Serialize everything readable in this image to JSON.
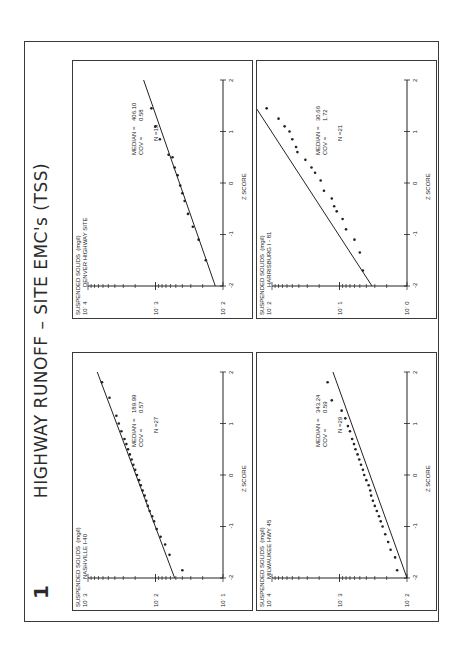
{
  "slide": {
    "number": "1",
    "title": "HIGHWAY RUNOFF  –  SITE EMC's  (TSS)"
  },
  "axis": {
    "y_label": "SUSPENDED SOLIDS  (mg/l)",
    "x_label": "Z  SCORE",
    "z_ticks": [
      "-2",
      "-1",
      "0",
      "1",
      "2"
    ]
  },
  "panels": [
    {
      "id": "nashville",
      "site": "NASHVILLE   I-40",
      "y_ticks": [
        "10ˈ 3",
        "10ˈ 2",
        "10ˈ 1"
      ],
      "median_label": "MEDIAN =",
      "median": "189.99",
      "cov_label": "COV   =",
      "cov": "0.57",
      "n_label": "N =27"
    },
    {
      "id": "milwaukee",
      "site": "MILWAUKEE   HWY 45",
      "y_ticks": [
        "10ˈ 4",
        "10ˈ 3",
        "10ˈ 2"
      ],
      "median_label": "MEDIAN =",
      "median": "343.24",
      "cov_label": "COV   =",
      "cov": "0.59",
      "n_label": "N =29"
    },
    {
      "id": "denver",
      "site": "DENVER  HIGHWAY SITE",
      "y_ticks": [
        "10ˈ 4",
        "10ˈ 3",
        "10ˈ 2"
      ],
      "median_label": "MEDIAN =",
      "median": "406.10",
      "cov_label": "COV   =",
      "cov": "0.58",
      "n_label": "N =15"
    },
    {
      "id": "harrisburg",
      "site": "HARRISBURG   I - 81",
      "y_ticks": [
        "10ˈ 2",
        "10ˈ 1",
        "10ˈ 0"
      ],
      "median_label": "MEDIAN =",
      "median": "30.66",
      "cov_label": "COV   =",
      "cov": "1.72",
      "n_label": "N =21"
    }
  ],
  "chart_data": [
    {
      "type": "scatter",
      "title": "NASHVILLE I-40",
      "xlabel": "Z SCORE",
      "ylabel": "SUSPENDED SOLIDS (mg/l)",
      "xlim": [
        -2,
        2
      ],
      "ylim": [
        10,
        1000
      ],
      "yscale": "log",
      "fit_line": {
        "x": [
          -2,
          2
        ],
        "y": [
          52,
          730
        ]
      },
      "x": [
        -1.85,
        -1.55,
        -1.35,
        -1.2,
        -1.05,
        -0.9,
        -0.8,
        -0.7,
        -0.6,
        -0.5,
        -0.4,
        -0.3,
        -0.2,
        -0.1,
        0.0,
        0.1,
        0.2,
        0.3,
        0.4,
        0.5,
        0.6,
        0.7,
        0.85,
        1.0,
        1.15,
        1.5,
        1.8
      ],
      "y": [
        40,
        62,
        72,
        84,
        96,
        105,
        112,
        122,
        130,
        137,
        145,
        155,
        165,
        175,
        188,
        200,
        213,
        226,
        240,
        255,
        270,
        288,
        320,
        350,
        380,
        480,
        620
      ],
      "median": 189.99,
      "cov": 0.57,
      "n": 27
    },
    {
      "type": "scatter",
      "title": "MILWAUKEE HWY 45",
      "xlabel": "Z SCORE",
      "ylabel": "SUSPENDED SOLIDS (mg/l)",
      "xlim": [
        -2,
        2
      ],
      "ylim": [
        100,
        10000
      ],
      "yscale": "log",
      "fit_line": {
        "x": [
          -2,
          2
        ],
        "y": [
          100,
          1250
        ]
      },
      "x": [
        -1.85,
        -1.6,
        -1.45,
        -1.3,
        -1.15,
        -1.0,
        -0.9,
        -0.8,
        -0.7,
        -0.6,
        -0.5,
        -0.4,
        -0.3,
        -0.2,
        -0.1,
        0.0,
        0.1,
        0.2,
        0.3,
        0.4,
        0.5,
        0.6,
        0.7,
        0.85,
        0.95,
        1.1,
        1.25,
        1.45,
        1.8
      ],
      "y": [
        140,
        150,
        175,
        190,
        210,
        230,
        245,
        260,
        280,
        300,
        320,
        340,
        350,
        370,
        400,
        430,
        450,
        480,
        510,
        540,
        580,
        610,
        650,
        700,
        750,
        820,
        930,
        1300,
        1500
      ],
      "median": 343.24,
      "cov": 0.59,
      "n": 29
    },
    {
      "type": "scatter",
      "title": "DENVER HIGHWAY SITE",
      "xlabel": "Z SCORE",
      "ylabel": "SUSPENDED SOLIDS (mg/l)",
      "xlim": [
        -2,
        2
      ],
      "ylim": [
        100,
        10000
      ],
      "yscale": "log",
      "fit_line": {
        "x": [
          -2,
          2
        ],
        "y": [
          130,
          1500
        ]
      },
      "x": [
        -1.5,
        -1.1,
        -0.85,
        -0.6,
        -0.35,
        -0.2,
        -0.05,
        0.15,
        0.3,
        0.5,
        0.55,
        0.85,
        1.1,
        1.45
      ],
      "y": [
        180,
        230,
        280,
        330,
        370,
        400,
        430,
        470,
        520,
        560,
        640,
        860,
        1000,
        1150
      ],
      "median": 406.1,
      "cov": 0.58,
      "n": 15
    },
    {
      "type": "scatter",
      "title": "HARRISBURG I-81",
      "xlabel": "Z SCORE",
      "ylabel": "SUSPENDED SOLIDS (mg/l)",
      "xlim": [
        -2,
        2
      ],
      "ylim": [
        1,
        100
      ],
      "yscale": "log",
      "fit_line": {
        "x": [
          -2,
          2
        ],
        "y": [
          3.3,
          320
        ]
      },
      "x": [
        -1.7,
        -1.35,
        -1.1,
        -0.9,
        -0.7,
        -0.55,
        -0.45,
        -0.3,
        -0.15,
        0.05,
        0.2,
        0.3,
        0.45,
        0.6,
        0.7,
        0.85,
        1.0,
        1.1,
        1.25,
        1.45
      ],
      "y": [
        4.5,
        5,
        6,
        8,
        9,
        11,
        12,
        13,
        17,
        19,
        23,
        26,
        32,
        42,
        44,
        50,
        55,
        65,
        80,
        120
      ],
      "median": 30.66,
      "cov": 1.72,
      "n": 21
    }
  ]
}
